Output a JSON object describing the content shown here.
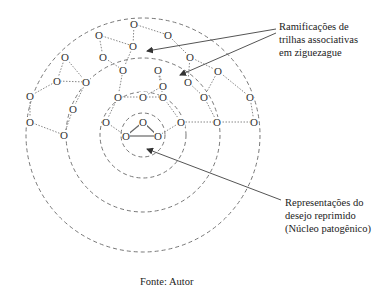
{
  "diagram": {
    "center": {
      "x": 143,
      "y": 135
    },
    "rings": [
      22,
      43,
      77,
      117
    ],
    "node_glyph": "O",
    "core_nodes": [
      {
        "x": 143,
        "y": 122
      },
      {
        "x": 126,
        "y": 136
      },
      {
        "x": 158,
        "y": 136
      }
    ],
    "nodes": [
      {
        "x": 134,
        "y": 24
      },
      {
        "x": 99,
        "y": 35
      },
      {
        "x": 168,
        "y": 35
      },
      {
        "x": 65,
        "y": 57
      },
      {
        "x": 103,
        "y": 57
      },
      {
        "x": 133,
        "y": 46
      },
      {
        "x": 190,
        "y": 57
      },
      {
        "x": 123,
        "y": 70
      },
      {
        "x": 158,
        "y": 70
      },
      {
        "x": 188,
        "y": 82
      },
      {
        "x": 218,
        "y": 71
      },
      {
        "x": 57,
        "y": 81
      },
      {
        "x": 86,
        "y": 82
      },
      {
        "x": 163,
        "y": 86
      },
      {
        "x": 118,
        "y": 97
      },
      {
        "x": 143,
        "y": 97
      },
      {
        "x": 163,
        "y": 97
      },
      {
        "x": 204,
        "y": 97
      },
      {
        "x": 250,
        "y": 97
      },
      {
        "x": 30,
        "y": 96
      },
      {
        "x": 73,
        "y": 109
      },
      {
        "x": 106,
        "y": 122
      },
      {
        "x": 181,
        "y": 122
      },
      {
        "x": 217,
        "y": 122
      },
      {
        "x": 254,
        "y": 122
      },
      {
        "x": 30,
        "y": 122
      },
      {
        "x": 64,
        "y": 135
      }
    ],
    "labels": {
      "top": [
        "Ramificações de",
        "trilhas associativas",
        "em ziguezague"
      ],
      "bottom": [
        "Representações do",
        "desejo reprimido",
        "(Núcleo patogênico)"
      ]
    },
    "caption": "Fonte: Autor"
  }
}
